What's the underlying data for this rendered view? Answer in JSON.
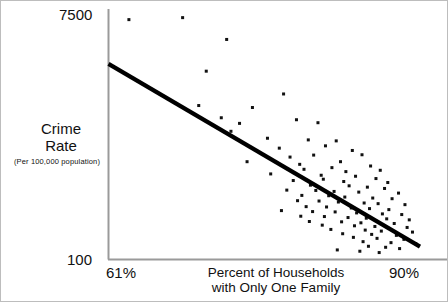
{
  "figure": {
    "background_color": "#ffffff",
    "border_color": "#bdbdbd",
    "ink_color": "#111111"
  },
  "axes": {
    "y_tick_top": "7500",
    "y_tick_bottom": "100",
    "y_title_line1": "Crime",
    "y_title_line2": "Rate",
    "y_subtitle": "(Per 100,000 population)",
    "x_tick_left": "61%",
    "x_tick_right": "90%",
    "x_title_line1": "Percent of Households",
    "x_title_line2": "with Only One Family"
  },
  "chart_data": {
    "type": "scatter",
    "title": "",
    "xlabel": "Percent of Households with Only One Family",
    "ylabel": "Crime Rate (Per 100,000 population)",
    "xlim": [
      61,
      90
    ],
    "ylim": [
      100,
      7500
    ],
    "x_tick_labels": [
      "61%",
      "90%"
    ],
    "y_tick_labels": [
      "100",
      "7500"
    ],
    "grid": false,
    "legend": "none",
    "annotations": [],
    "trendline": {
      "type": "linear",
      "x_start": 61.0,
      "y_start": 6020,
      "x_end": 90.0,
      "y_end": 490,
      "color": "#000000",
      "width_px": 4.2
    },
    "marker": {
      "shape": "square",
      "size_px": 3.0,
      "color": "#111111"
    },
    "points": [
      [
        62.9,
        7360
      ],
      [
        67.9,
        7420
      ],
      [
        70.1,
        5800
      ],
      [
        72.0,
        6760
      ],
      [
        77.3,
        5110
      ],
      [
        74.4,
        4700
      ],
      [
        69.4,
        4760
      ],
      [
        71.5,
        4390
      ],
      [
        73.2,
        4220
      ],
      [
        78.5,
        4330
      ],
      [
        80.5,
        4240
      ],
      [
        72.4,
        3980
      ],
      [
        75.8,
        3770
      ],
      [
        79.6,
        3720
      ],
      [
        82.2,
        3690
      ],
      [
        76.9,
        3470
      ],
      [
        81.2,
        3540
      ],
      [
        83.7,
        3400
      ],
      [
        77.9,
        3200
      ],
      [
        80.1,
        3260
      ],
      [
        84.6,
        3270
      ],
      [
        73.9,
        3060
      ],
      [
        78.8,
        2980
      ],
      [
        82.6,
        3060
      ],
      [
        85.4,
        2930
      ],
      [
        79.2,
        2830
      ],
      [
        81.8,
        2880
      ],
      [
        83.1,
        2760
      ],
      [
        86.3,
        2800
      ],
      [
        76.1,
        2690
      ],
      [
        80.8,
        2650
      ],
      [
        84.0,
        2620
      ],
      [
        85.9,
        2550
      ],
      [
        78.2,
        2490
      ],
      [
        81.0,
        2530
      ],
      [
        82.9,
        2460
      ],
      [
        87.0,
        2430
      ],
      [
        79.8,
        2350
      ],
      [
        83.4,
        2330
      ],
      [
        85.1,
        2290
      ],
      [
        86.7,
        2250
      ],
      [
        77.6,
        2200
      ],
      [
        80.3,
        2190
      ],
      [
        82.0,
        2160
      ],
      [
        84.3,
        2140
      ],
      [
        88.0,
        2110
      ],
      [
        79.0,
        2040
      ],
      [
        81.5,
        2030
      ],
      [
        83.0,
        1990
      ],
      [
        85.6,
        1960
      ],
      [
        87.4,
        1940
      ],
      [
        78.6,
        1880
      ],
      [
        80.6,
        1870
      ],
      [
        82.4,
        1840
      ],
      [
        84.8,
        1810
      ],
      [
        86.1,
        1790
      ],
      [
        88.6,
        1760
      ],
      [
        79.4,
        1700
      ],
      [
        81.3,
        1690
      ],
      [
        83.6,
        1660
      ],
      [
        85.3,
        1640
      ],
      [
        87.1,
        1610
      ],
      [
        77.1,
        1580
      ],
      [
        80.0,
        1550
      ],
      [
        82.1,
        1540
      ],
      [
        84.1,
        1510
      ],
      [
        86.5,
        1480
      ],
      [
        88.3,
        1460
      ],
      [
        78.9,
        1410
      ],
      [
        81.1,
        1400
      ],
      [
        83.3,
        1370
      ],
      [
        85.0,
        1350
      ],
      [
        86.9,
        1330
      ],
      [
        89.0,
        1300
      ],
      [
        79.7,
        1250
      ],
      [
        82.7,
        1240
      ],
      [
        84.5,
        1210
      ],
      [
        87.6,
        1190
      ],
      [
        80.9,
        1140
      ],
      [
        83.9,
        1120
      ],
      [
        85.8,
        1100
      ],
      [
        88.8,
        1070
      ],
      [
        81.7,
        1010
      ],
      [
        84.9,
        990
      ],
      [
        86.4,
        960
      ],
      [
        89.3,
        930
      ],
      [
        82.8,
        880
      ],
      [
        85.5,
        860
      ],
      [
        87.8,
        830
      ],
      [
        83.8,
        770
      ],
      [
        86.0,
        740
      ],
      [
        88.5,
        710
      ],
      [
        84.7,
        640
      ],
      [
        87.3,
        610
      ],
      [
        89.6,
        580
      ],
      [
        85.2,
        500
      ],
      [
        86.8,
        470
      ],
      [
        88.1,
        430
      ],
      [
        82.3,
        390
      ],
      [
        84.4,
        350
      ],
      [
        86.2,
        310
      ]
    ]
  }
}
